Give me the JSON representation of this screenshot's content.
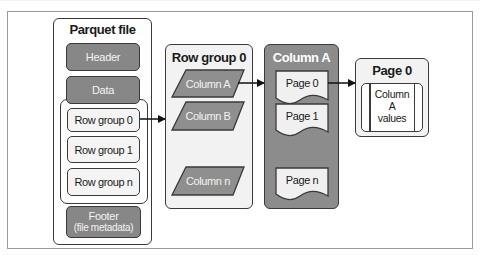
{
  "diagram": {
    "type": "parquet-file-structure",
    "parquet_file": {
      "title": "Parquet file",
      "header_label": "Header",
      "data_label": "Data",
      "row_groups": [
        {
          "label": "Row group 0"
        },
        {
          "label": "Row group 1"
        },
        {
          "label": "Row group n"
        }
      ],
      "footer_label": "Footer",
      "footer_sublabel": "(file metadata)"
    },
    "row_group_detail": {
      "title": "Row group 0",
      "columns": [
        {
          "label": "Column A"
        },
        {
          "label": "Column B"
        },
        {
          "label": "Column n"
        }
      ]
    },
    "column_detail": {
      "title": "Column A",
      "pages": [
        {
          "label": "Page 0"
        },
        {
          "label": "Page 1"
        },
        {
          "label": "Page n"
        }
      ]
    },
    "page_detail": {
      "title": "Page 0",
      "content_line1": "Column",
      "content_line2": "A",
      "content_line3": "values"
    },
    "arrows": [
      {
        "from": "Row group 0",
        "to": "Row group 0 detail"
      },
      {
        "from": "Column A",
        "to": "Column A detail"
      },
      {
        "from": "Page 0",
        "to": "Page 0 detail"
      }
    ],
    "colors": {
      "dark_fill": "#878787",
      "column_panel_fill": "#8c8c8c",
      "light_fill": "#f2f2f2",
      "outline": "#3a3a3a",
      "frame": "#9a9a9a"
    }
  }
}
